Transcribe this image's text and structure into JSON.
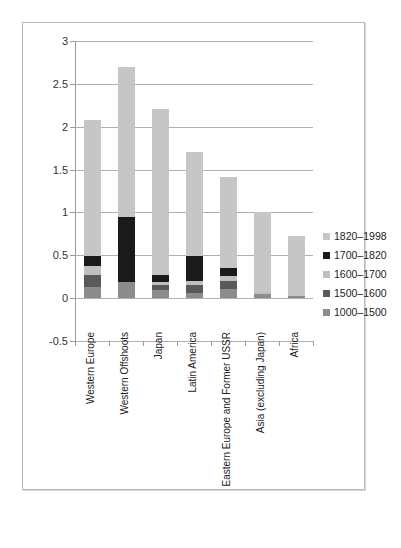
{
  "chart_data": {
    "type": "bar",
    "stacked": true,
    "title": "",
    "xlabel": "",
    "ylabel": "",
    "ylim": [
      -0.5,
      3
    ],
    "ytick_labels": [
      "3",
      "2.5",
      "2",
      "1.5",
      "1",
      "0.5",
      "0",
      "-0.5"
    ],
    "ytick_values": [
      3,
      2.5,
      2,
      1.5,
      1,
      0.5,
      0,
      -0.5
    ],
    "grid": true,
    "legend_position": "right",
    "categories": [
      "Western Europe",
      "Western Offshoots",
      "Japan",
      "Latin America",
      "Eastern Europe and Former USSR",
      "Asia (excluding Japan)",
      "Africa"
    ],
    "series": [
      {
        "name": "1000–1500",
        "color": "#8c8c8c",
        "values": [
          0.13,
          0.19,
          0.09,
          0.06,
          0.11,
          0.05,
          0.03
        ]
      },
      {
        "name": "1500–1600",
        "color": "#595959",
        "values": [
          0.14,
          0.0,
          0.06,
          0.09,
          0.09,
          0.0,
          0.0
        ]
      },
      {
        "name": "1600–1700",
        "color": "#bfbfbf",
        "values": [
          0.1,
          0.0,
          0.04,
          0.05,
          0.06,
          0.02,
          0.0
        ]
      },
      {
        "name": "1700–1820",
        "color": "#1a1a1a",
        "values": [
          0.12,
          0.76,
          0.08,
          0.29,
          0.09,
          0.0,
          0.0
        ]
      },
      {
        "name": "1820–1998",
        "color": "#c6c6c6",
        "values": [
          1.59,
          1.75,
          1.94,
          1.21,
          1.06,
          0.93,
          0.69
        ]
      }
    ],
    "totals": [
      2.08,
      2.7,
      2.21,
      1.7,
      1.41,
      1.0,
      0.72
    ],
    "legend": [
      {
        "label": "1820–1998",
        "color": "#c6c6c6"
      },
      {
        "label": "1700–1820",
        "color": "#1a1a1a"
      },
      {
        "label": "1600–1700",
        "color": "#bfbfbf"
      },
      {
        "label": "1500–1600",
        "color": "#595959"
      },
      {
        "label": "1000–1500",
        "color": "#8c8c8c"
      }
    ]
  }
}
